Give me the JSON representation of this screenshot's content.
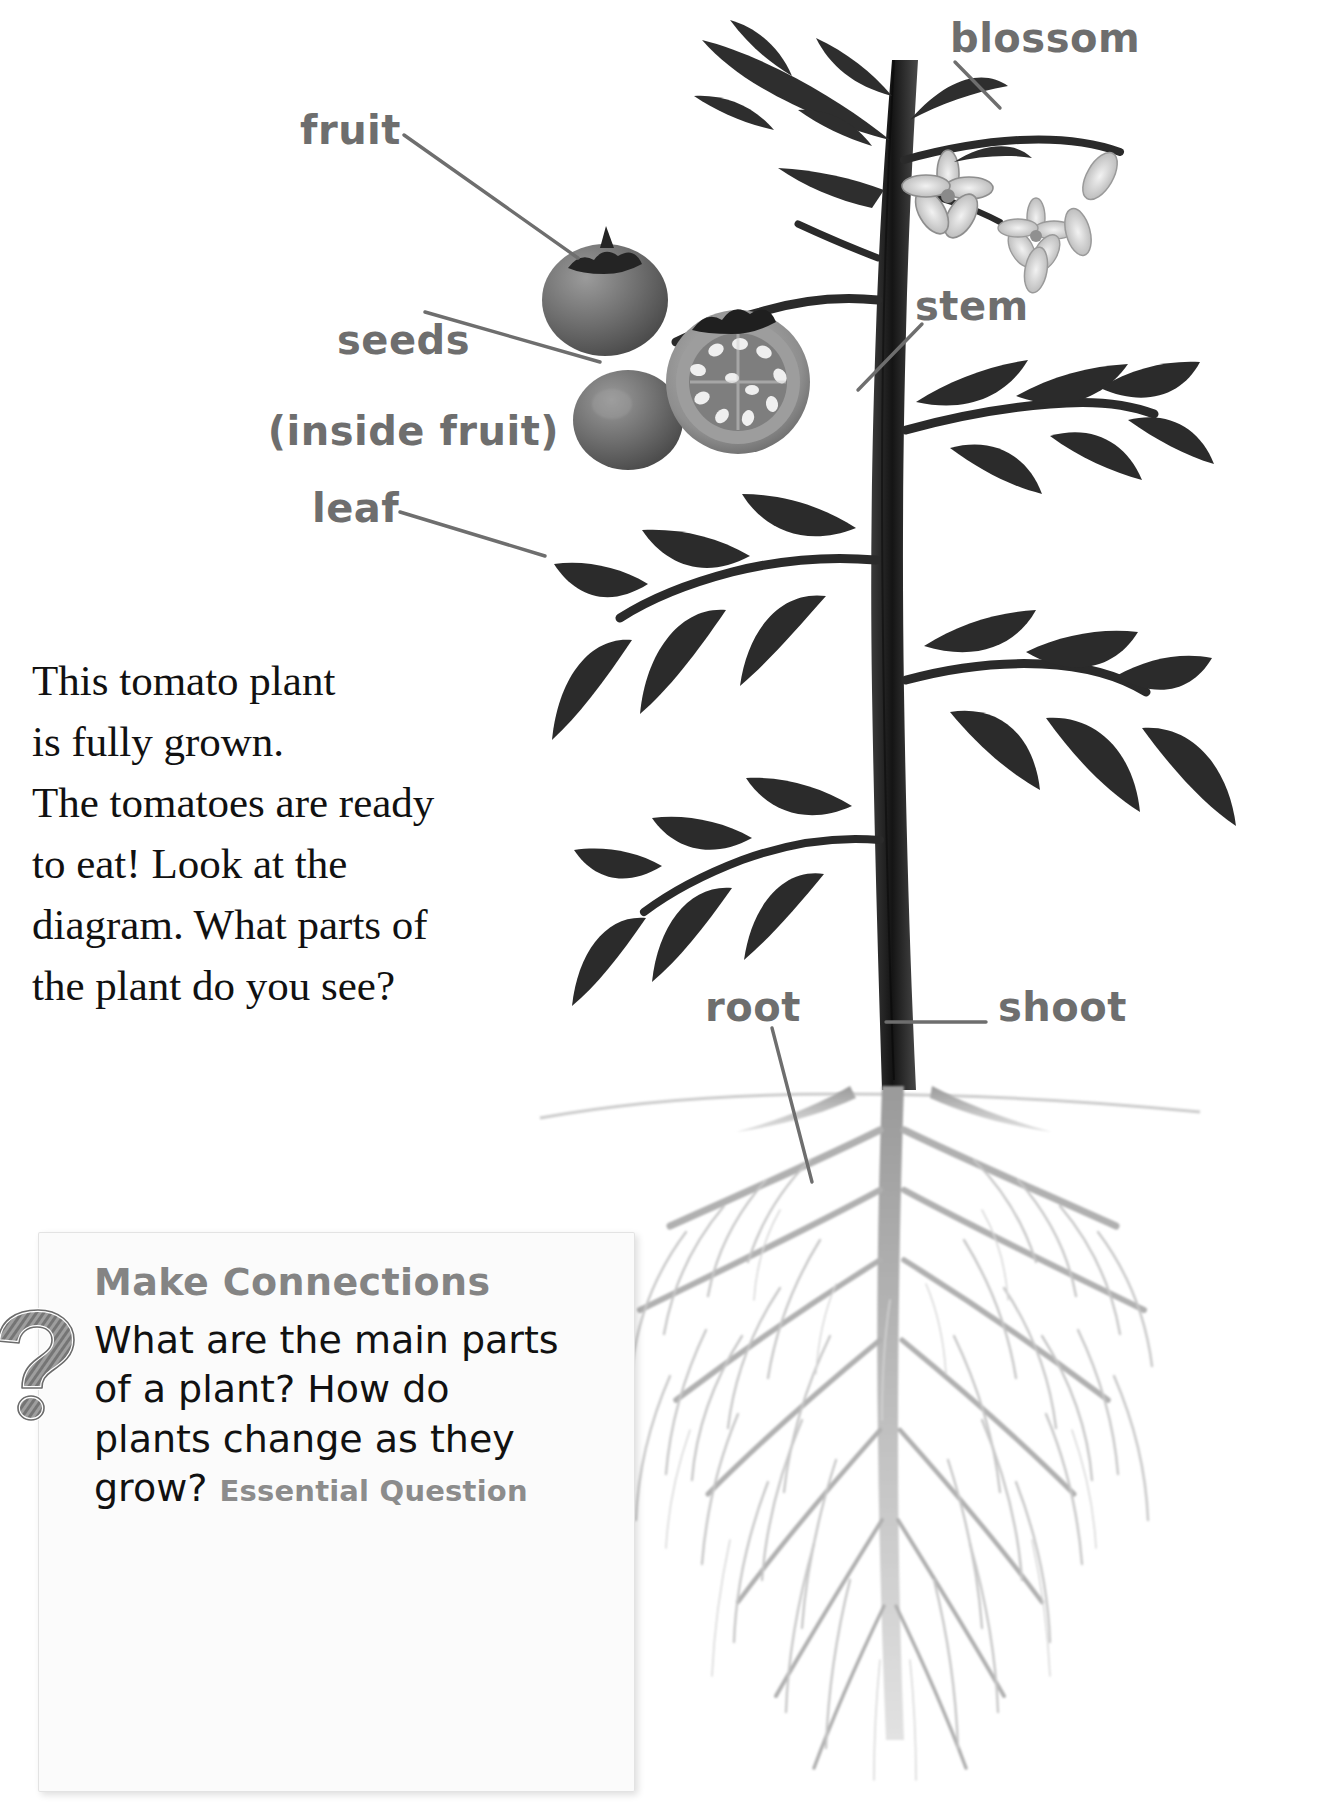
{
  "diagram": {
    "subject": "tomato plant",
    "labels": [
      {
        "id": "fruit",
        "text": "fruit"
      },
      {
        "id": "blossom",
        "text": "blossom"
      },
      {
        "id": "seeds",
        "line1": "seeds",
        "line2": "(inside fruit)"
      },
      {
        "id": "stem",
        "text": "stem"
      },
      {
        "id": "leaf",
        "text": "leaf"
      },
      {
        "id": "root",
        "text": "root"
      },
      {
        "id": "shoot",
        "text": "shoot"
      }
    ],
    "label_color": "#6e6e6e",
    "leader_line_color": "#6e6e6e"
  },
  "body": {
    "lines": [
      "This tomato plant",
      "is fully grown.",
      "The tomatoes are ready",
      "to eat! Look at the",
      "diagram. What parts of",
      "the plant do you see?"
    ]
  },
  "make_connections": {
    "heading": "Make Connections",
    "icon": "question-mark-icon",
    "question_lines": [
      "What are the main parts",
      "of a plant? How do",
      "plants change as they"
    ],
    "last_line": "grow? ",
    "tag": "Essential Question",
    "heading_color": "#848484",
    "tag_color": "#8c8c8c"
  }
}
